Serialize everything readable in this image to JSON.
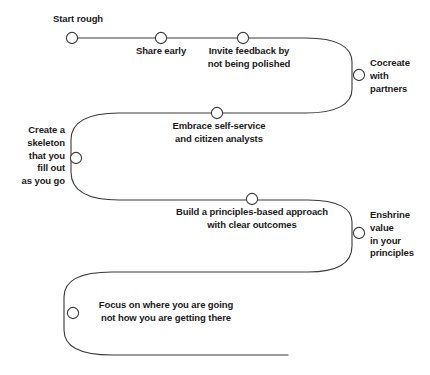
{
  "diagram": {
    "type": "snake-path-timeline",
    "stroke_color": "#3a3a3a",
    "node_fill": "#ffffff",
    "node_stroke": "#3a3a3a",
    "text_color": "#1a1a1a",
    "background": "#ffffff",
    "nodes": [
      {
        "id": "start-rough",
        "label": "Start rough",
        "x": 72,
        "y": 38,
        "align": "center",
        "label_x": 78,
        "label_y": 13
      },
      {
        "id": "share-early",
        "label": "Share early",
        "x": 161,
        "y": 38,
        "align": "center",
        "label_x": 161,
        "label_y": 45
      },
      {
        "id": "invite-feedback",
        "label": "Invite feedback by\nnot being polished",
        "x": 243,
        "y": 38,
        "align": "center",
        "label_x": 249,
        "label_y": 45
      },
      {
        "id": "cocreate",
        "label": "Cocreate\nwith\npartners",
        "x": 359,
        "y": 75,
        "align": "left",
        "label_x": 370,
        "label_y": 57
      },
      {
        "id": "embrace-self-serve",
        "label": "Embrace self-service\nand citizen analysts",
        "x": 217,
        "y": 113,
        "align": "center",
        "label_x": 219,
        "label_y": 120
      },
      {
        "id": "create-skeleton",
        "label": "Create a\nskeleton\nthat you\nfill out\nas you go",
        "x": 76,
        "y": 158,
        "align": "right",
        "label_x": 17,
        "label_y": 124
      },
      {
        "id": "build-principles",
        "label": "Build a principles-based approach\nwith clear outcomes",
        "x": 252,
        "y": 199,
        "align": "center",
        "label_x": 252,
        "label_y": 206
      },
      {
        "id": "enshrine-value",
        "label": "Enshrine\nvalue\nin your\nprinciples",
        "x": 359,
        "y": 233,
        "align": "left",
        "label_x": 370,
        "label_y": 209
      },
      {
        "id": "focus-on-where",
        "label": "Focus on where you are going\nnot how you are getting there",
        "x": 73,
        "y": 313,
        "align": "left",
        "label_x": 85,
        "label_y": 299
      }
    ],
    "path": "M 72 38 L 310 38 C 352 38 352 38 352 57 L 352 57 C 352 94 352 113 310 113 L 118 113 C 76 113 71 118 71 138 L 71 178 C 71 196 76 200 118 200 L 312 200 C 354 200 352 205 352 222 L 352 250 C 352 268 350 272 308 272 L 110 272 C 68 272 64 277 64 295 L 64 332 C 64 350 68 355 110 355 L 288 355"
  }
}
